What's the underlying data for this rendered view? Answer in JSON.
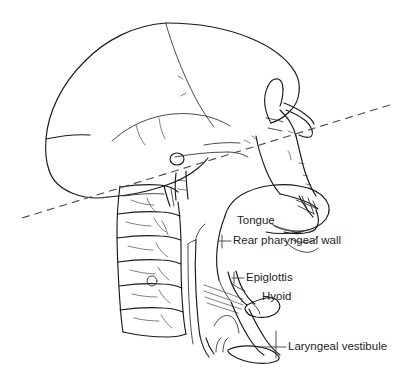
{
  "figure": {
    "background_color": "#ffffff",
    "ink_color": "#1a1a1a",
    "text_color": "#242424"
  },
  "reference_plane": {
    "name": "dashed-reference-line",
    "style": "dashed",
    "color": "#4a4a4a",
    "start": {
      "x": 22,
      "y": 218
    },
    "end": {
      "x": 393,
      "y": 104
    }
  },
  "labels": [
    {
      "id": "tongue",
      "text": "Tongue",
      "x": 237,
      "y": 221,
      "leader": false
    },
    {
      "id": "rear-pharyngeal-wall",
      "text": "Rear pharyngeal wall",
      "x": 233,
      "y": 241,
      "leader": true
    },
    {
      "id": "epiglottis",
      "text": "Epiglottis",
      "x": 246,
      "y": 278,
      "leader": true
    },
    {
      "id": "hyoid",
      "text": "Hyoid",
      "x": 262,
      "y": 297,
      "leader": false
    },
    {
      "id": "laryngeal-vestibule",
      "text": "Laryngeal vestibule",
      "x": 288,
      "y": 347,
      "leader": true
    }
  ],
  "structures": [
    {
      "id": "cranial-vault",
      "name": "Cranial vault"
    },
    {
      "id": "coronal-suture",
      "name": "Coronal suture"
    },
    {
      "id": "frontal-bone",
      "name": "Frontal bone"
    },
    {
      "id": "occipital-bone",
      "name": "Occipital bone"
    },
    {
      "id": "external-auditory-meatus",
      "name": "External auditory meatus"
    },
    {
      "id": "nasal-cavity",
      "name": "Nasal cavity"
    },
    {
      "id": "hard-palate",
      "name": "Hard palate"
    },
    {
      "id": "maxillary-teeth",
      "name": "Maxillary teeth"
    },
    {
      "id": "mandible",
      "name": "Mandible"
    },
    {
      "id": "cervical-vertebrae",
      "name": "Cervical vertebral column"
    },
    {
      "id": "tongue-body",
      "name": "Tongue body"
    },
    {
      "id": "pharyngeal-wall",
      "name": "Rear pharyngeal wall"
    },
    {
      "id": "epiglottis-cartilage",
      "name": "Epiglottis"
    },
    {
      "id": "hyoid-bone",
      "name": "Hyoid bone"
    },
    {
      "id": "larynx",
      "name": "Larynx and laryngeal vestibule"
    },
    {
      "id": "trachea",
      "name": "Trachea"
    }
  ]
}
